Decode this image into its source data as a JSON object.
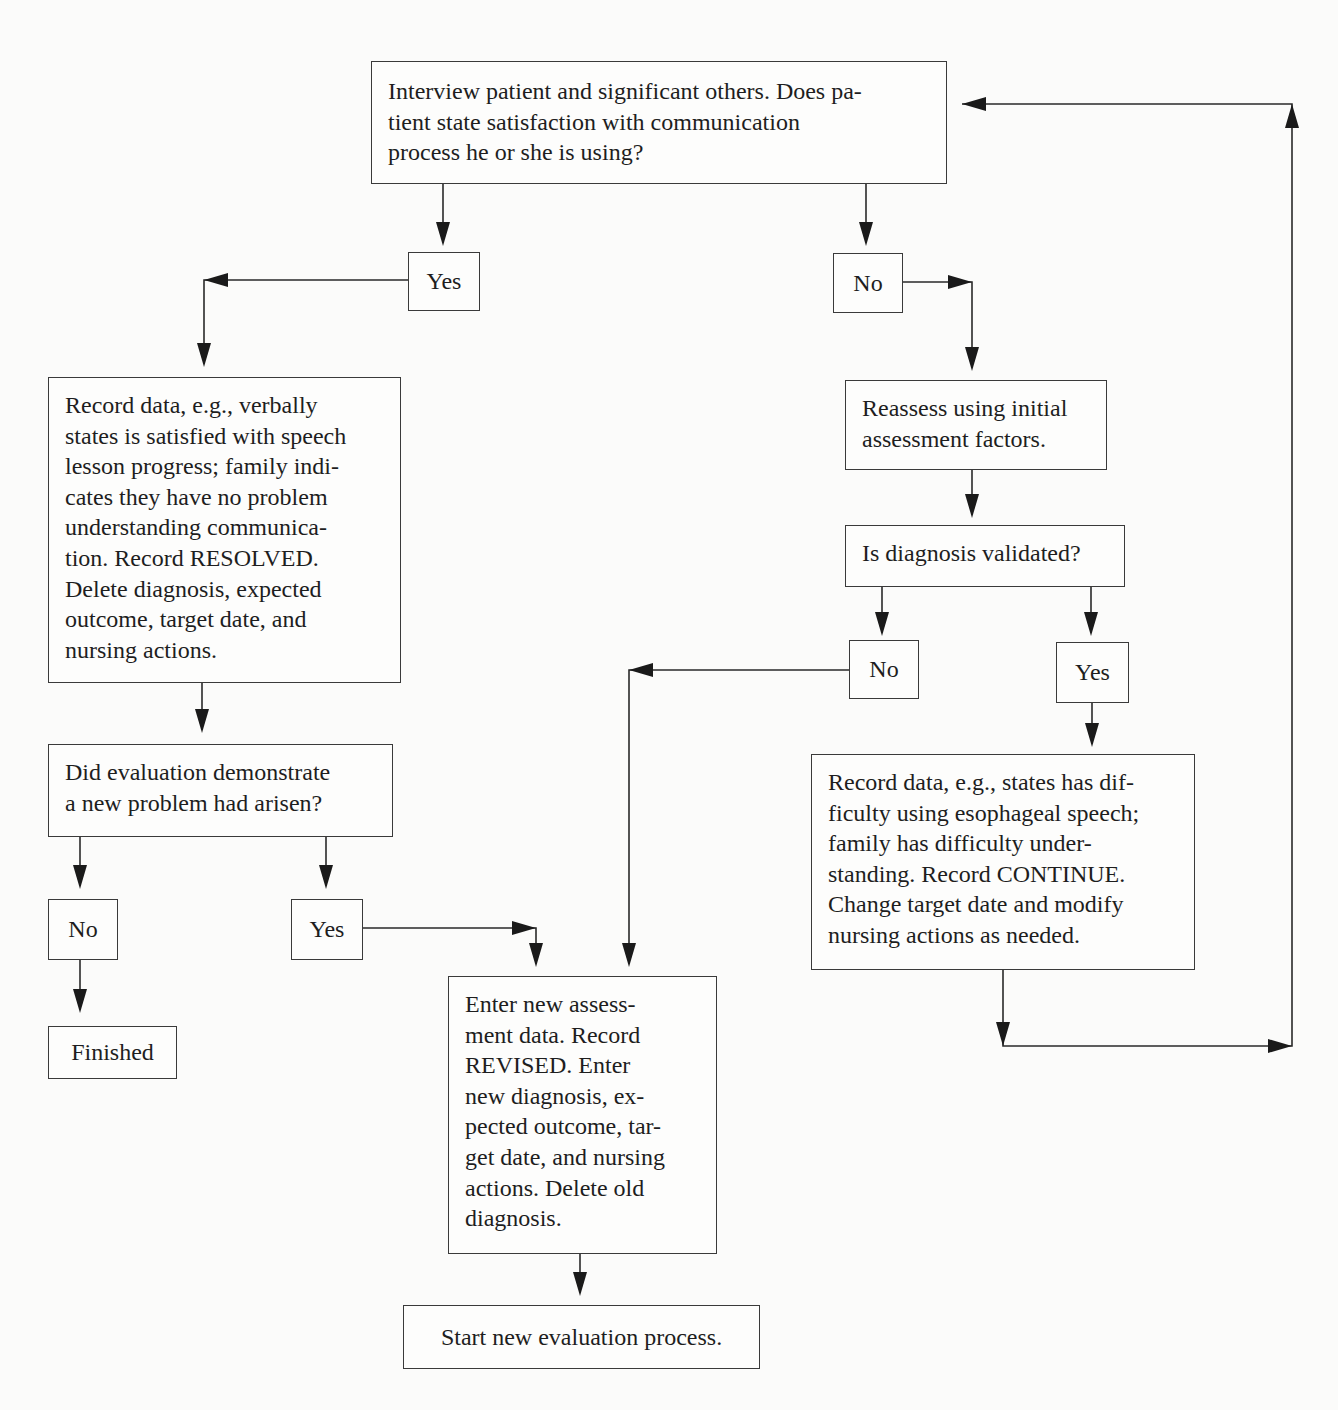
{
  "flowchart": {
    "nodes": {
      "interview": {
        "text": "Interview patient and significant others. Does pa-\ntient state satisfaction with communication\nprocess he or she is using?"
      },
      "yes_satisfied": {
        "text": "Yes"
      },
      "no_satisfied": {
        "text": "No"
      },
      "record_resolved": {
        "text": "Record data, e.g., verbally\nstates is satisfied with speech\nlesson progress; family indi-\ncates they have no problem\nunderstanding communica-\ntion. Record RESOLVED.\nDelete diagnosis, expected\noutcome, target date, and\nnursing actions."
      },
      "reassess": {
        "text": "Reassess using initial\nassessment factors."
      },
      "diagnosis_validated": {
        "text": "Is diagnosis validated?"
      },
      "no_validated": {
        "text": "No"
      },
      "yes_validated": {
        "text": "Yes"
      },
      "record_continue": {
        "text": "Record data, e.g., states has dif-\nficulty using esophageal speech;\nfamily has difficulty under-\nstanding. Record CONTINUE.\nChange target date and modify\nnursing actions as needed."
      },
      "new_problem": {
        "text": "Did evaluation demonstrate\na new problem had arisen?"
      },
      "no_new_problem": {
        "text": "No"
      },
      "yes_new_problem": {
        "text": "Yes"
      },
      "finished": {
        "text": "Finished"
      },
      "record_revised": {
        "text": "Enter new assess-\nment data. Record\nREVISED. Enter\nnew diagnosis, ex-\npected outcome, tar-\nget date, and nursing\nactions. Delete old\ndiagnosis."
      },
      "start_new": {
        "text": "Start new evaluation process."
      }
    },
    "edges": [
      {
        "from": "interview",
        "to": "yes_satisfied"
      },
      {
        "from": "interview",
        "to": "no_satisfied"
      },
      {
        "from": "yes_satisfied",
        "to": "record_resolved"
      },
      {
        "from": "no_satisfied",
        "to": "reassess"
      },
      {
        "from": "reassess",
        "to": "diagnosis_validated"
      },
      {
        "from": "diagnosis_validated",
        "to": "no_validated"
      },
      {
        "from": "diagnosis_validated",
        "to": "yes_validated"
      },
      {
        "from": "yes_validated",
        "to": "record_continue"
      },
      {
        "from": "record_continue",
        "to": "interview"
      },
      {
        "from": "no_validated",
        "to": "record_revised"
      },
      {
        "from": "record_resolved",
        "to": "new_problem"
      },
      {
        "from": "new_problem",
        "to": "no_new_problem"
      },
      {
        "from": "new_problem",
        "to": "yes_new_problem"
      },
      {
        "from": "no_new_problem",
        "to": "finished"
      },
      {
        "from": "yes_new_problem",
        "to": "record_revised"
      },
      {
        "from": "record_revised",
        "to": "start_new"
      }
    ]
  }
}
